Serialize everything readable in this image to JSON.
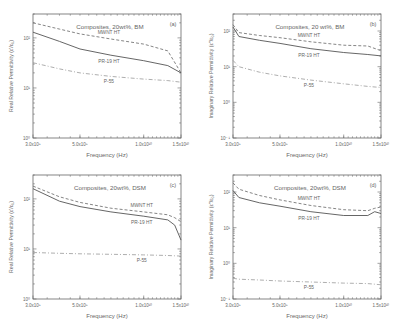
{
  "figure": {
    "panels": [
      {
        "id": "a",
        "label": "(a)",
        "title": "Composites, 20wt%, BM",
        "ylabel": "Real Relative Permittivity (ε'/ε₀)"
      },
      {
        "id": "b",
        "label": "(b)",
        "title": "Composites, 20 wt%, BM",
        "ylabel": "Imaginary Relative Permittivity (ε''/ε₀)"
      },
      {
        "id": "c",
        "label": "(c)",
        "title": "Composites, 20wt%, DSM",
        "ylabel": "Real Relative Permittivity (ε'/ε₀)"
      },
      {
        "id": "d",
        "label": "(d)",
        "title": "Composites, 20wt%, DSM",
        "ylabel": "Imaginary Relative Permittivity (ε''/ε₀)"
      }
    ],
    "xlabel": "Frequency (Hz)",
    "xticks": [
      "3.0x10⁹",
      "5.0x10⁹",
      "1.0x10¹⁰",
      "1.5x10¹⁰"
    ]
  },
  "chart_data": [
    {
      "type": "line",
      "title": "Composites, 20wt%, BM",
      "panel_label": "(a)",
      "xlabel": "Frequency (Hz)",
      "ylabel": "Real Relative Permittivity (ε'/ε₀)",
      "xscale": "log",
      "yscale": "log",
      "xlim": [
        3000000000.0,
        15000000000.0
      ],
      "ylim": [
        1,
        300
      ],
      "yticks": [
        "10⁰",
        "10¹",
        "10²"
      ],
      "xticks": [
        "3.0x10⁹",
        "5.0x10⁹",
        "1.0x10¹⁰",
        "1.5x10¹⁰"
      ],
      "x": [
        3000000000.0,
        4000000000.0,
        5000000000.0,
        7000000000.0,
        10000000000.0,
        13000000000.0,
        15000000000.0
      ],
      "series": [
        {
          "name": "MWNT HT",
          "style": "dashed",
          "values": [
            200,
            150,
            120,
            95,
            75,
            55,
            20
          ]
        },
        {
          "name": "PR-19 HT",
          "style": "solid",
          "values": [
            130,
            85,
            60,
            45,
            35,
            28,
            20
          ]
        },
        {
          "name": "P-55",
          "style": "dash-dot",
          "values": [
            32,
            24,
            20,
            17,
            15,
            14,
            13
          ]
        }
      ]
    },
    {
      "type": "line",
      "title": "Composites, 20 wt%, BM",
      "panel_label": "(b)",
      "xlabel": "Frequency (Hz)",
      "ylabel": "Imaginary Relative Permittivity (ε''/ε₀)",
      "xscale": "log",
      "yscale": "log",
      "xlim": [
        3000000000.0,
        15000000000.0
      ],
      "ylim": [
        0.1,
        300
      ],
      "yticks": [
        "10⁻¹",
        "10⁰",
        "10¹",
        "10²"
      ],
      "xticks": [
        "3.0x10⁹",
        "5.0x10⁹",
        "1.0x10¹⁰",
        "1.5x10¹⁰"
      ],
      "x": [
        3000000000.0,
        3200000000.0,
        4000000000.0,
        5000000000.0,
        7000000000.0,
        10000000000.0,
        13000000000.0,
        15000000000.0
      ],
      "series": [
        {
          "name": "MWNT HT",
          "style": "dashed",
          "values": [
            150,
            90,
            75,
            65,
            50,
            40,
            38,
            28
          ]
        },
        {
          "name": "PR-19 HT",
          "style": "solid",
          "values": [
            130,
            70,
            55,
            45,
            32,
            25,
            22,
            20
          ]
        },
        {
          "name": "P-55",
          "style": "dash-dot",
          "values": [
            15,
            10,
            7,
            5.5,
            4.2,
            3.3,
            2.8,
            2.6
          ]
        }
      ]
    },
    {
      "type": "line",
      "title": "Composites, 20wt%, DSM",
      "panel_label": "(c)",
      "xlabel": "Frequency (Hz)",
      "ylabel": "Real Relative Permittivity (ε'/ε₀)",
      "xscale": "log",
      "yscale": "log",
      "xlim": [
        3000000000.0,
        15000000000.0
      ],
      "ylim": [
        1,
        300
      ],
      "yticks": [
        "10⁰",
        "10¹",
        "10²"
      ],
      "xticks": [
        "3.0x10⁹",
        "5.0x10⁹",
        "1.0x10¹⁰",
        "1.5x10¹⁰"
      ],
      "x": [
        3000000000.0,
        4000000000.0,
        5000000000.0,
        7000000000.0,
        10000000000.0,
        13000000000.0,
        14000000000.0,
        15000000000.0
      ],
      "series": [
        {
          "name": "MWNT HT",
          "style": "dashed",
          "values": [
            180,
            110,
            85,
            65,
            55,
            48,
            42,
            35
          ]
        },
        {
          "name": "PR-19 HT",
          "style": "solid",
          "values": [
            160,
            90,
            70,
            55,
            45,
            38,
            30,
            15
          ]
        },
        {
          "name": "P-55",
          "style": "dash-dot",
          "values": [
            8.5,
            8.2,
            8.0,
            7.8,
            7.6,
            7.4,
            7.3,
            7.2
          ]
        }
      ]
    },
    {
      "type": "line",
      "title": "Composites, 20wt%, DSM",
      "panel_label": "(d)",
      "xlabel": "Frequency (Hz)",
      "ylabel": "Imaginary Relative Permittivity (ε''/ε₀)",
      "xscale": "log",
      "yscale": "log",
      "xlim": [
        3000000000.0,
        15000000000.0
      ],
      "ylim": [
        0.1,
        300
      ],
      "yticks": [
        "10⁻¹",
        "10⁰",
        "10¹",
        "10²"
      ],
      "xticks": [
        "3.0x10⁹",
        "5.0x10⁹",
        "1.0x10¹⁰",
        "1.5x10¹⁰"
      ],
      "x": [
        3000000000.0,
        3200000000.0,
        4000000000.0,
        5000000000.0,
        7000000000.0,
        10000000000.0,
        13000000000.0,
        14000000000.0,
        15000000000.0
      ],
      "series": [
        {
          "name": "MWNT HT",
          "style": "dashed",
          "values": [
            180,
            120,
            80,
            60,
            42,
            32,
            30,
            35,
            38
          ]
        },
        {
          "name": "PR-19 HT",
          "style": "solid",
          "values": [
            110,
            70,
            50,
            40,
            28,
            22,
            22,
            28,
            25
          ]
        },
        {
          "name": "P-55",
          "style": "dash-dot",
          "values": [
            0.38,
            0.36,
            0.34,
            0.32,
            0.3,
            0.28,
            0.27,
            0.26,
            0.25
          ]
        }
      ]
    }
  ]
}
